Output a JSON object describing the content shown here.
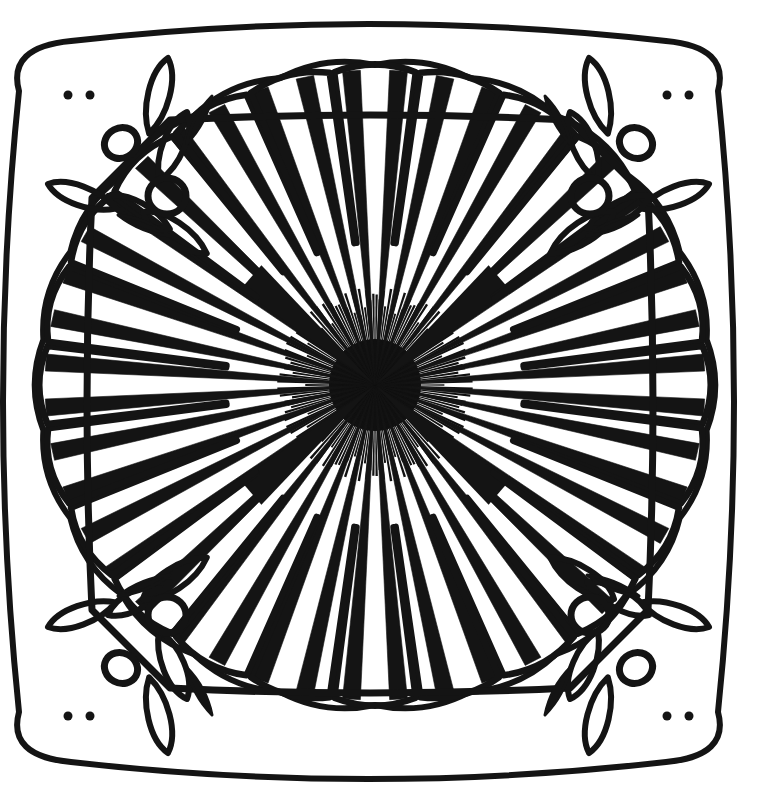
{
  "canvas": {
    "width": 757,
    "height": 811,
    "background_color": "#ffffff",
    "ink_color": "#141414",
    "title": "Mandala Coloring Page"
  },
  "artwork": {
    "kind": "line-art-mandala",
    "description": "Black-and-white mandala coloring page: rounded square frame with ornamental corners, a scalloped petal ring, and a dense radial sunburst core.",
    "center": {
      "x": 375,
      "y": 385
    },
    "stroke_width": 6
  },
  "frame": {
    "name": "outer-rounded-square-frame",
    "left": 13,
    "top": 33,
    "right": 724,
    "bottom": 770,
    "bulge": 26,
    "stroke_width": 6
  },
  "inner_frame": {
    "name": "inner-ornament-frame",
    "left": 92,
    "top": 120,
    "right": 648,
    "bottom": 688,
    "bulge": 10,
    "stroke_width": 7
  },
  "petal_ring": {
    "name": "outer-petal-ring",
    "count": 24,
    "inner_radius": 150,
    "outer_radius": 330,
    "half_angle_deg": 7.1,
    "stroke_width": 6.5
  },
  "scallop_disc": {
    "name": "scalloped-inner-disc",
    "count": 22,
    "radius_x": 335,
    "radius_y": 320,
    "scallop_depth": 14,
    "stroke_width": 6
  },
  "rays": {
    "name": "radial-ray-burst",
    "count": 44,
    "outer_radius_x": 330,
    "outer_radius_y": 315,
    "tip_width_deg": 1.55,
    "core_radius": 40
  },
  "long_spikes": {
    "name": "long-accent-spikes",
    "count": 4,
    "angles_deg": [
      41,
      139,
      221,
      319
    ],
    "length": 165,
    "width_deg": 5.5
  },
  "core": {
    "name": "dense-center-burst",
    "radius": 46,
    "spike_count": 170,
    "spike_length": 52,
    "color": "#111111"
  },
  "corner_ornaments": {
    "name": "corner-ornament-group",
    "quadrants": [
      {
        "id": "top-left",
        "flip_x": false,
        "flip_y": false
      },
      {
        "id": "top-right",
        "flip_x": true,
        "flip_y": false
      },
      {
        "id": "bottom-left",
        "flip_x": false,
        "flip_y": true
      },
      {
        "id": "bottom-right",
        "flip_x": true,
        "flip_y": true
      }
    ],
    "teardrops": [
      {
        "name": "teardrop-outer-upper",
        "x": 168,
        "y": 58,
        "length": 78,
        "width": 30,
        "angle_deg": 104
      },
      {
        "name": "teardrop-inner-upper",
        "x": 187,
        "y": 112,
        "length": 74,
        "width": 30,
        "angle_deg": 112
      },
      {
        "name": "teardrop-side-outer",
        "x": 48,
        "y": 184,
        "length": 72,
        "width": 27,
        "angle_deg": 20
      },
      {
        "name": "teardrop-side-inner",
        "x": 108,
        "y": 196,
        "length": 70,
        "width": 27,
        "angle_deg": 28
      },
      {
        "name": "teardrop-diagonal",
        "x": 143,
        "y": 212,
        "length": 76,
        "width": 30,
        "angle_deg": 33
      }
    ],
    "rings": [
      {
        "name": "ornament-ring-upper",
        "x": 121,
        "y": 143,
        "rx": 17,
        "ry": 15,
        "angle_deg": -28
      },
      {
        "name": "ornament-ring-lower",
        "x": 167,
        "y": 196,
        "rx": 19,
        "ry": 18,
        "angle_deg": 0
      }
    ],
    "leaf_blades": [
      {
        "name": "leaf-blade-a",
        "x": 212,
        "y": 96,
        "length": 54,
        "width": 16,
        "angle_deg": 118
      },
      {
        "name": "leaf-blade-b",
        "x": 118,
        "y": 215,
        "length": 56,
        "width": 16,
        "angle_deg": 22
      }
    ],
    "nubs": [
      {
        "name": "frame-nub-top",
        "x": 68,
        "y": 95
      },
      {
        "name": "frame-nub-left",
        "x": 667,
        "y": 95
      }
    ]
  },
  "legend": {
    "layers": [
      "outer-rounded-square-frame",
      "corner-ornament-group",
      "inner-ornament-frame",
      "outer-petal-ring",
      "scalloped-inner-disc",
      "radial-ray-burst",
      "dense-center-burst"
    ]
  }
}
